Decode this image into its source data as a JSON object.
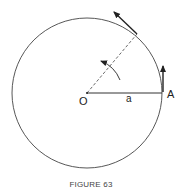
{
  "figure": {
    "caption": "FIGURE 63",
    "labels": {
      "center": "O",
      "radius": "a",
      "point": "A"
    },
    "colors": {
      "stroke": "#333333",
      "background": "#ffffff"
    }
  }
}
